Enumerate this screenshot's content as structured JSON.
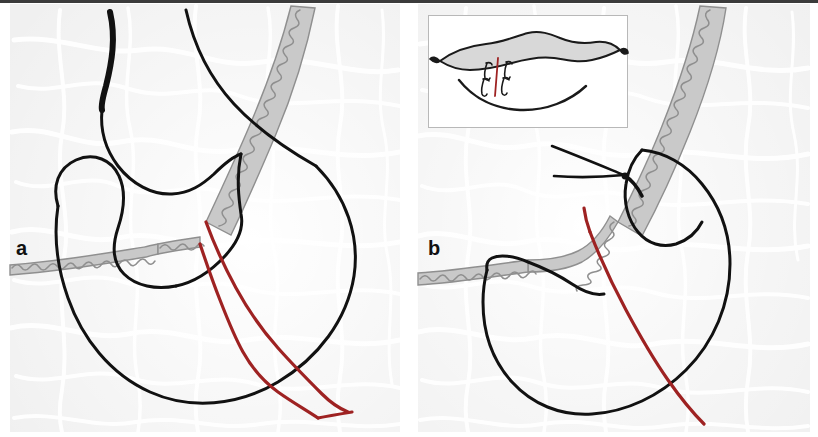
{
  "figure": {
    "kind": "medical-surgical-illustration",
    "caption_labels": [
      "a",
      "b"
    ],
    "panels": [
      {
        "id": "a",
        "label": "a",
        "label_position": {
          "x": 16,
          "y": 238
        },
        "title": "Stomach and distal esophagus with hiatal/crural outline and planned resection lines",
        "structures": [
          "esophagus-outline",
          "gastric-fundus-outline",
          "greater-curvature-outline",
          "diaphragm-crus-band",
          "diaphragm-crus-band-left",
          "resection-line-medial",
          "resection-line-lateral"
        ]
      },
      {
        "id": "b",
        "label": "b",
        "label_position": {
          "x": 428,
          "y": 238
        },
        "title": "Post-reconstruction gastric conduit with crural repair sutures",
        "structures": [
          "gastric-conduit-outline",
          "diaphragm-crus-band",
          "diaphragm-crus-band-left",
          "suture-threads",
          "staple-resection-line"
        ]
      }
    ],
    "inset": {
      "position": {
        "x": 428,
        "y": 15,
        "width": 200,
        "height": 113
      },
      "title": "En-face detail of closure with interrupted sutures",
      "border_color": "#b8b8b8",
      "elements": [
        "upper-flap-outline",
        "lower-flap-outline",
        "suture-stitch-1",
        "suture-stitch-2",
        "suture-stitch-3",
        "suture-stitch-4",
        "suture-line-red"
      ],
      "suture_count": 4
    },
    "colors": {
      "outline": "#1a1a1a",
      "resection_red": "#9e2222",
      "crus_gray_fill": "#c9c9c9",
      "crus_gray_stroke": "#8f8f8f",
      "background_tissue": "#f1f1f1",
      "vein_highlight": "#ffffff",
      "inset_border": "#b8b8b8",
      "top_rule": "#3b3b3b",
      "label_text": "#111111"
    },
    "top_rule": {
      "visible": true,
      "height_px": 3
    }
  }
}
